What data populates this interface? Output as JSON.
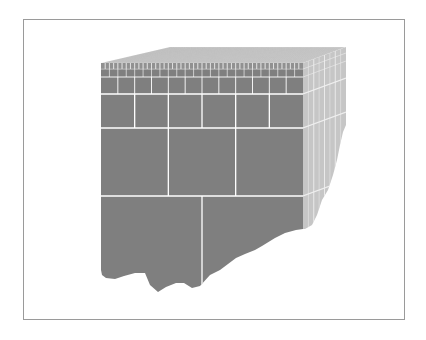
{
  "diagram": {
    "colors": {
      "background": "#ffffff",
      "frame": "#9a9a9a",
      "front_face": "#7f7f7f",
      "side_face": "#c6c6c6",
      "top_face": "#e4e4e4",
      "grid_line": "#ffffff",
      "side_grid_line": "#eeeeee",
      "top_grid_line": "#b8b8b8"
    },
    "front_face": {
      "left": 101,
      "right": 303,
      "top": 63,
      "outline": [
        [
          101,
          63
        ],
        [
          303,
          63
        ],
        [
          303,
          229
        ],
        [
          296,
          230
        ],
        [
          285,
          233
        ],
        [
          275,
          238
        ],
        [
          262,
          246
        ],
        [
          255,
          250
        ],
        [
          245,
          254
        ],
        [
          236,
          258
        ],
        [
          228,
          264
        ],
        [
          220,
          270
        ],
        [
          210,
          275
        ],
        [
          200,
          286
        ],
        [
          192,
          288
        ],
        [
          184,
          283
        ],
        [
          176,
          283
        ],
        [
          166,
          287
        ],
        [
          158,
          292
        ],
        [
          150,
          285
        ],
        [
          145,
          273
        ],
        [
          135,
          273
        ],
        [
          124,
          276
        ],
        [
          115,
          279
        ],
        [
          106,
          278
        ],
        [
          102,
          275
        ],
        [
          101,
          270
        ]
      ],
      "rows": [
        {
          "y0": 63,
          "y1": 69,
          "columns": 48
        },
        {
          "y0": 69,
          "y1": 77,
          "columns": 24
        },
        {
          "y0": 77,
          "y1": 94,
          "columns": 12
        },
        {
          "y0": 94,
          "y1": 128,
          "columns": 6
        },
        {
          "y0": 128,
          "y1": 196,
          "columns": 3
        },
        {
          "y0": 196,
          "y1": 292,
          "columns": 2
        }
      ]
    },
    "side_face": {
      "outline": [
        [
          303,
          63
        ],
        [
          346,
          47
        ],
        [
          346,
          125
        ],
        [
          343,
          132
        ],
        [
          340,
          145
        ],
        [
          337,
          160
        ],
        [
          333,
          175
        ],
        [
          328,
          190
        ],
        [
          322,
          200
        ],
        [
          317,
          215
        ],
        [
          312,
          225
        ],
        [
          305,
          229
        ],
        [
          303,
          229
        ]
      ],
      "depth_dx": 43,
      "depth_dy": -16,
      "depth_divisions": 8
    },
    "top_face": {
      "outline": [
        [
          101,
          63
        ],
        [
          170,
          47
        ],
        [
          346,
          47
        ],
        [
          303,
          63
        ]
      ],
      "depth_divisions": 16,
      "width_divisions": 96
    }
  }
}
